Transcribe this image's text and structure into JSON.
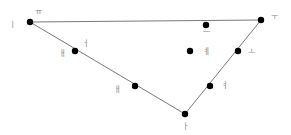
{
  "diagram": {
    "type": "triangle-with-points",
    "line_color": "#7a7a7a",
    "point_color": "#000000",
    "label_color": "#8a8a8a",
    "vertices": [
      {
        "id": "A",
        "x": 30,
        "y": 22
      },
      {
        "id": "B",
        "x": 261,
        "y": 20
      },
      {
        "id": "C",
        "x": 185,
        "y": 114
      }
    ],
    "edges": [
      [
        "A",
        "B"
      ],
      [
        "B",
        "C"
      ],
      [
        "C",
        "A"
      ]
    ],
    "points": [
      {
        "id": "A",
        "x": 30,
        "y": 22,
        "label": "ㅣ",
        "lx": 12,
        "ly": 25
      },
      {
        "id": "A2",
        "x": 30,
        "y": 22,
        "label": "ㅠ",
        "lx": 38,
        "ly": 12
      },
      {
        "id": "B",
        "x": 261,
        "y": 20,
        "label": "ㅜ",
        "lx": 274,
        "ly": 17
      },
      {
        "id": "C",
        "x": 185,
        "y": 114,
        "label": "ㅏ",
        "lx": 185,
        "ly": 127
      },
      {
        "id": "P1",
        "x": 75,
        "y": 51,
        "label": "ㅓ",
        "lx": 85,
        "ly": 44
      },
      {
        "id": "P1b",
        "x": 75,
        "y": 51,
        "label": "ㅐ",
        "lx": 62,
        "ly": 54
      },
      {
        "id": "P2",
        "x": 135,
        "y": 86,
        "label": "ㅐ",
        "lx": 117,
        "ly": 90
      },
      {
        "id": "P3",
        "x": 206,
        "y": 25,
        "label": "ㅡ",
        "lx": 206,
        "ly": 33
      },
      {
        "id": "P4",
        "x": 238,
        "y": 51,
        "label": "ㅗ",
        "lx": 251,
        "ly": 52
      },
      {
        "id": "P5",
        "x": 210,
        "y": 86,
        "label": "ㅕ",
        "lx": 224,
        "ly": 86
      },
      {
        "id": "P6",
        "x": 190,
        "y": 51,
        "label": "ㅖ",
        "lx": 206,
        "ly": 52
      }
    ]
  }
}
